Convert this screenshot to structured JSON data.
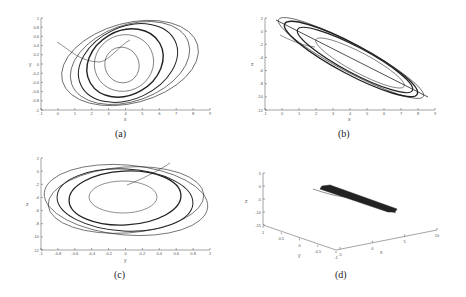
{
  "chart_data": [
    {
      "id": "a",
      "type": "line",
      "caption": "(a)",
      "title": "",
      "xlabel": "x",
      "ylabel": "y",
      "xticks": [
        "-1",
        "0",
        "1",
        "2",
        "3",
        "4",
        "5",
        "6",
        "7",
        "8",
        "9"
      ],
      "yticks": [
        "1",
        "0.8",
        "0.6",
        "0.4",
        "0.2",
        "0",
        "-0.2",
        "-0.4",
        "-0.6",
        "-0.8",
        "-1"
      ],
      "xlim": [
        -1,
        9
      ],
      "ylim": [
        -1,
        1
      ],
      "grid": false,
      "description": "Phase portrait x-y: nested closed loops (attractor) centered near x=4, y=0"
    },
    {
      "id": "b",
      "type": "line",
      "caption": "(b)",
      "title": "",
      "xlabel": "x",
      "ylabel": "z",
      "xticks": [
        "-1",
        "0",
        "1",
        "2",
        "3",
        "4",
        "5",
        "6",
        "7",
        "8",
        "9"
      ],
      "yticks": [
        "2",
        "0",
        "-2",
        "-4",
        "-6",
        "-8",
        "-10",
        "-12"
      ],
      "xlim": [
        -1,
        9
      ],
      "ylim": [
        -12,
        2
      ],
      "grid": false,
      "description": "Phase portrait x-z: elongated loops along a diagonal from (0,1) to (8.5,-10)"
    },
    {
      "id": "c",
      "type": "line",
      "caption": "(c)",
      "title": "",
      "xlabel": "y",
      "ylabel": "z",
      "xticks": [
        "-1",
        "-0.8",
        "-0.6",
        "-0.4",
        "-0.2",
        "0",
        "0.2",
        "0.4",
        "0.6",
        "0.8",
        "1"
      ],
      "yticks": [
        "2",
        "0",
        "-2",
        "-4",
        "-6",
        "-8",
        "-10",
        "-12"
      ],
      "xlim": [
        -1,
        1
      ],
      "ylim": [
        -12,
        2
      ],
      "grid": false,
      "description": "Phase portrait y-z: nested elliptical loops centered near y=0, z=-4"
    },
    {
      "id": "d",
      "type": "line",
      "caption": "(d)",
      "title": "",
      "xlabel": "x",
      "ylabel": "y",
      "zlabel": "z",
      "xticks": [
        "-5",
        "0",
        "5",
        "10"
      ],
      "yticks": [
        "1",
        "0.5",
        "0",
        "-0.5",
        "-1"
      ],
      "zticks": [
        "5",
        "0",
        "-5",
        "-10",
        "-15"
      ],
      "xlim": [
        -5,
        10
      ],
      "ylim": [
        -1,
        1
      ],
      "zlim": [
        -15,
        5
      ],
      "grid": false,
      "description": "3D phase portrait x-y-z: thin band-like attractor"
    }
  ]
}
